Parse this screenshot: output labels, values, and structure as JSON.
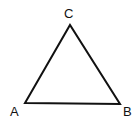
{
  "diagram": {
    "type": "triangle",
    "stroke_color": "#111111",
    "vertices": [
      {
        "label": "A",
        "x": 25,
        "y": 103,
        "lx": 10,
        "ly": 116
      },
      {
        "label": "B",
        "x": 120,
        "y": 104,
        "lx": 123,
        "ly": 116
      },
      {
        "label": "C",
        "x": 70,
        "y": 25,
        "lx": 64,
        "ly": 18
      }
    ]
  }
}
